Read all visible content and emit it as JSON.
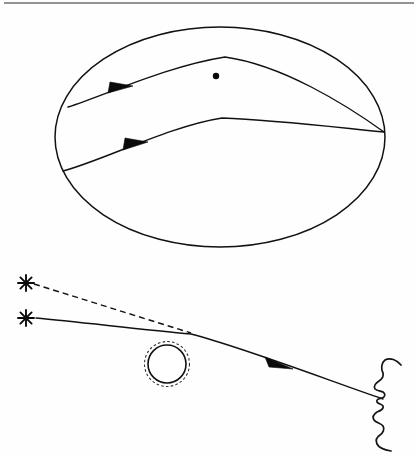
{
  "figure": {
    "background_color": "#fefefe",
    "ink_color": "#111111",
    "width": 418,
    "height": 456,
    "top_rule": {
      "label": "horizontal rule",
      "color": "#6f6f6f",
      "y": 3,
      "x_start": 4,
      "x_end": 414
    }
  },
  "upper_panel": {
    "name": "curved-spacetime-shell",
    "caption": "",
    "shell": {
      "label": "ellipse outline",
      "center_x": 220,
      "center_y": 137,
      "radius_x": 165,
      "radius_y": 110,
      "color": "#111111"
    },
    "mass_point": {
      "label": "central point mass",
      "x": 216,
      "y": 76,
      "radius": 3.2,
      "color": "#0a0a0a"
    },
    "convergence_point": {
      "label": "image convergence point",
      "x": 384,
      "y": 132
    },
    "rays": [
      {
        "label": "upper deflected geodesic",
        "entry_x": 68,
        "entry_y": 107,
        "bend_x": 225,
        "bend_y": 57,
        "exit_x": 384,
        "exit_y": 132,
        "arrow_x": 123,
        "arrow_y": 89
      },
      {
        "label": "lower deflected geodesic",
        "entry_x": 63,
        "entry_y": 171,
        "bend_x": 222,
        "bend_y": 118,
        "exit_x": 384,
        "exit_y": 132,
        "arrow_x": 139,
        "arrow_y": 145
      }
    ]
  },
  "lower_panel": {
    "name": "lens-observer-ray-diagram",
    "caption": "",
    "sources": [
      {
        "label": "apparent source star",
        "glyph": "star-icon",
        "x": 26,
        "y": 283,
        "size": 8
      },
      {
        "label": "true source star",
        "glyph": "star-icon",
        "x": 26,
        "y": 318,
        "size": 8
      }
    ],
    "lens": {
      "label": "lensing mass with einstein ring",
      "center_x": 167,
      "center_y": 364,
      "radius_solid": 19,
      "radius_dashed": 22.5,
      "solid_color": "#111111",
      "dashed_color": "#333333"
    },
    "observer": {
      "label": "observer face profile",
      "x": 370,
      "y": 372,
      "facing": "left"
    },
    "rays": [
      {
        "label": "apparent light path (dashed)",
        "style": "dashed",
        "start_x": 34,
        "start_y": 284,
        "end_x": 191,
        "end_y": 333
      },
      {
        "label": "actual deflected light path (solid)",
        "style": "solid",
        "start_x": 36,
        "start_y": 318,
        "bend_x": 191,
        "bend_y": 333,
        "end_x": 383,
        "end_y": 399,
        "arrow_x": 280,
        "arrow_y": 366
      }
    ]
  }
}
